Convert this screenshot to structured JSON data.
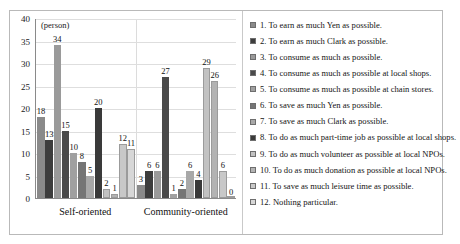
{
  "chart_data": {
    "type": "bar",
    "title": "",
    "subtitle": "",
    "xlabel": "",
    "ylabel": "",
    "unit_label": "(person)",
    "ylim": [
      0,
      40
    ],
    "yticks": [
      0,
      5,
      10,
      15,
      20,
      25,
      30,
      35,
      40
    ],
    "grid": true,
    "legend_position": "right",
    "categories": [
      "Self-oriented",
      "Community-oriented"
    ],
    "series": [
      {
        "name": "1. To earn as much Yen as possible.",
        "values": [
          18,
          3
        ],
        "color": "#8a8a8a"
      },
      {
        "name": "2. To earn as much Clark as possible.",
        "values": [
          13,
          6
        ],
        "color": "#3d3d3d"
      },
      {
        "name": "3. To consume as much as possible.",
        "values": [
          34,
          6
        ],
        "color": "#9a9a9a"
      },
      {
        "name": "4. To consume as much as possible at local shops.",
        "values": [
          15,
          27
        ],
        "color": "#4a4a4a"
      },
      {
        "name": "5. To consume as much as possible at chain stores.",
        "values": [
          10,
          1
        ],
        "color": "#a0a0a0"
      },
      {
        "name": "6. To save as much Yen as possible.",
        "values": [
          8,
          2
        ],
        "color": "#757575"
      },
      {
        "name": "7. To save as much Clark as possible.",
        "values": [
          5,
          6
        ],
        "color": "#a8a8a8"
      },
      {
        "name": "8. To do as much part-time job as possible at local shops.",
        "values": [
          20,
          4
        ],
        "color": "#3a3a3a"
      },
      {
        "name": "9. To do as much volunteer as possible at local NPOs.",
        "values": [
          2,
          29
        ],
        "color": "#c2c2c2"
      },
      {
        "name": "10. To do as much donation as possible at local NPOs.",
        "values": [
          1,
          26
        ],
        "color": "#b3b3b3"
      },
      {
        "name": "11. To save as much leisure time as possible.",
        "values": [
          12,
          6
        ],
        "color": "#c8c8c8"
      },
      {
        "name": "12. Nothing particular.",
        "values": [
          11,
          0
        ],
        "color": "#d7d7d7"
      }
    ]
  }
}
